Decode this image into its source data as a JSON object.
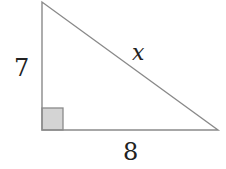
{
  "diagram": {
    "type": "right-triangle",
    "labels": {
      "vertical_leg": "7",
      "horizontal_leg": "8",
      "hypotenuse": "x"
    },
    "colors": {
      "stroke": "#8a8a8a",
      "right_angle_fill": "#d4d4d4",
      "text": "#222222"
    }
  }
}
